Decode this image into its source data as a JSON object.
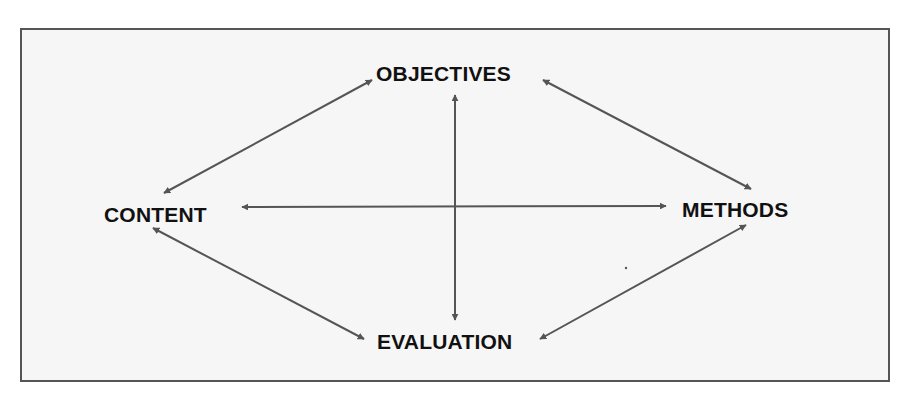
{
  "diagram": {
    "type": "relationship-diagram",
    "nodes": {
      "objectives": "OBJECTIVES",
      "content": "CONTENT",
      "methods": "METHODS",
      "evaluation": "EVALUATION"
    },
    "edges": [
      {
        "from": "objectives",
        "to": "content",
        "bidirectional": true
      },
      {
        "from": "objectives",
        "to": "methods",
        "bidirectional": true
      },
      {
        "from": "objectives",
        "to": "evaluation",
        "bidirectional": true
      },
      {
        "from": "content",
        "to": "methods",
        "bidirectional": true
      },
      {
        "from": "content",
        "to": "evaluation",
        "bidirectional": true
      },
      {
        "from": "methods",
        "to": "evaluation",
        "bidirectional": true
      }
    ],
    "colors": {
      "frame_border": "#555555",
      "frame_fill": "#f6f6f6",
      "arrow": "#555555",
      "text": "#111111"
    }
  }
}
